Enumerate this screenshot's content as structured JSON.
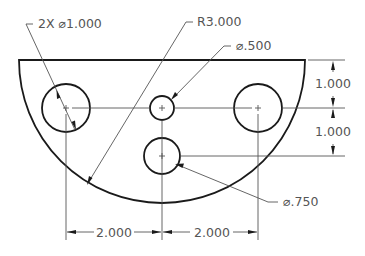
{
  "drawing": {
    "type": "dimensioned-part",
    "part": "half-disc plate with four holes",
    "colors": {
      "object_line": "#1a1a1a",
      "dimension_line": "#555555",
      "text": "#555555",
      "background": "#ffffff"
    }
  },
  "callouts": {
    "large_holes": "2X ⌀1.000",
    "outer_radius": "R3.000",
    "small_hole": "⌀.500",
    "medium_hole": "⌀.750"
  },
  "dimensions": {
    "vertical_top": "1.000",
    "vertical_bottom": "1.000",
    "horizontal_left": "2.000",
    "horizontal_right": "2.000"
  }
}
